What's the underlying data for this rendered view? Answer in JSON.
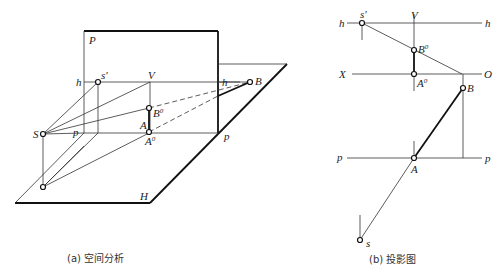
{
  "figure_a": {
    "caption": "(a) 空间分析",
    "labels": {
      "P": "P",
      "h_left": "h",
      "h_right": "h",
      "s_prime": "s'",
      "V": "V",
      "B0": "B",
      "B0_sup": "0",
      "A": "A",
      "A0": "A",
      "A0_sup": "0",
      "S": "S",
      "p_left": "p",
      "p_right": "p",
      "B": "B",
      "H": "H"
    }
  },
  "figure_b": {
    "caption": "(b) 投影图",
    "labels": {
      "h_left": "h",
      "h_right": "h",
      "s_prime": "s'",
      "V": "V",
      "B0": "B",
      "B0_sup": "0",
      "X": "X",
      "O": "O",
      "A0": "A",
      "A0_sup": "0",
      "B": "B",
      "p_left": "p",
      "p_right": "p",
      "A": "A",
      "s": "s"
    }
  },
  "colors": {
    "line": "#333333",
    "thick_line": "#111111",
    "background": "#ffffff"
  }
}
